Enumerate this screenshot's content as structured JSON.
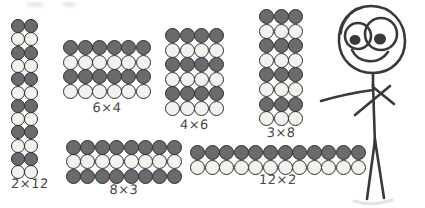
{
  "page": {
    "background_color": "#ffffff",
    "width": 425,
    "height": 208
  },
  "palette": {
    "dot_dark": "#6a6b6d",
    "dot_light": "#f2f2ee",
    "dot_outline": "#2e2e2e",
    "ink": "#4a4a4a",
    "figure_ink": "#3a3a3a"
  },
  "arrays": [
    {
      "id": "array-2x12",
      "label": "2×12",
      "columns": 2,
      "rows": 12,
      "total": 24,
      "shading": "alternating-rows",
      "first_row_shade": "dark",
      "x": 11,
      "y": 19,
      "dot": 14,
      "step": 13.3,
      "label_y": 176
    },
    {
      "id": "array-6x4",
      "label": "6×4",
      "columns": 6,
      "rows": 4,
      "total": 24,
      "shading": "alternating-rows",
      "first_row_shade": "dark",
      "x": 63,
      "y": 40,
      "dot": 15,
      "step": 14.6,
      "label_y": 100
    },
    {
      "id": "array-4x6",
      "label": "4×6",
      "columns": 4,
      "rows": 6,
      "total": 24,
      "shading": "alternating-rows",
      "first_row_shade": "dark",
      "x": 165,
      "y": 28,
      "dot": 15,
      "step": 14.6,
      "label_y": 117
    },
    {
      "id": "array-3x8",
      "label": "3×8",
      "columns": 3,
      "rows": 8,
      "total": 24,
      "shading": "alternating-rows",
      "first_row_shade": "dark",
      "x": 259,
      "y": 9,
      "dot": 15,
      "step": 14.6,
      "label_y": 125
    },
    {
      "id": "array-8x3",
      "label": "8×3",
      "columns": 8,
      "rows": 3,
      "total": 24,
      "shading": "alternating-rows",
      "first_row_shade": "dark",
      "x": 66,
      "y": 140,
      "dot": 15,
      "step": 14.4,
      "label_y": 182
    },
    {
      "id": "array-12x2",
      "label": "12×2",
      "columns": 12,
      "rows": 2,
      "total": 24,
      "shading": "alternating-rows",
      "first_row_shade": "dark",
      "x": 190,
      "y": 145,
      "dot": 15,
      "step": 14.6,
      "label_y": 172
    }
  ],
  "figure": {
    "name": "stick-figure-person",
    "parts": [
      "head-outline",
      "left-eye",
      "right-eye",
      "left-pupil",
      "right-pupil",
      "smile",
      "neck",
      "torso",
      "left-arm",
      "right-arm",
      "left-leg",
      "right-leg"
    ]
  }
}
